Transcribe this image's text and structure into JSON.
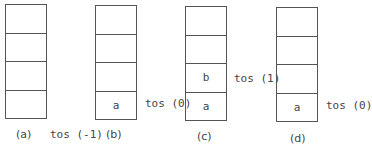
{
  "stacks": [
    {
      "caption": "(a)",
      "cells": [
        "",
        "",
        "",
        ""
      ],
      "tos_label": "tos (-1)"
    },
    {
      "caption": "(b)",
      "cells": [
        "",
        "",
        "",
        "a"
      ],
      "tos_label": "tos (0)"
    },
    {
      "caption": "(c)",
      "cells": [
        "",
        "",
        "b",
        "a"
      ],
      "tos_label": "tos (1)"
    },
    {
      "caption": "(d)",
      "cells": [
        "",
        "",
        "",
        "a"
      ],
      "tos_label": "tos (0)"
    }
  ]
}
